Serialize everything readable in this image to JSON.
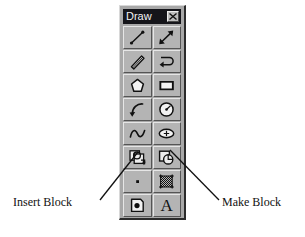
{
  "window": {
    "title": "Draw",
    "close_icon": "close-icon",
    "title_bar_color": "#15151a",
    "face_color": "#a8a8a8",
    "button_face_color": "#b4b4b4"
  },
  "toolbar": {
    "name": "Draw",
    "columns": 2,
    "rows": 8,
    "buttons": [
      {
        "row": 1,
        "col": 1,
        "name": "line",
        "icon": "line-icon",
        "tooltip": "Line"
      },
      {
        "row": 1,
        "col": 2,
        "name": "construction-line",
        "icon": "construction-line-icon",
        "tooltip": "Construction Line"
      },
      {
        "row": 2,
        "col": 1,
        "name": "multiline",
        "icon": "multiline-icon",
        "tooltip": "Multiline"
      },
      {
        "row": 2,
        "col": 2,
        "name": "polyline",
        "icon": "polyline-icon",
        "tooltip": "Polyline"
      },
      {
        "row": 3,
        "col": 1,
        "name": "polygon",
        "icon": "polygon-icon",
        "tooltip": "Polygon"
      },
      {
        "row": 3,
        "col": 2,
        "name": "rectangle",
        "icon": "rectangle-icon",
        "tooltip": "Rectangle"
      },
      {
        "row": 4,
        "col": 1,
        "name": "arc",
        "icon": "arc-icon",
        "tooltip": "Arc"
      },
      {
        "row": 4,
        "col": 2,
        "name": "circle",
        "icon": "circle-icon",
        "tooltip": "Circle"
      },
      {
        "row": 5,
        "col": 1,
        "name": "spline",
        "icon": "spline-icon",
        "tooltip": "Spline"
      },
      {
        "row": 5,
        "col": 2,
        "name": "ellipse",
        "icon": "ellipse-icon",
        "tooltip": "Ellipse"
      },
      {
        "row": 6,
        "col": 1,
        "name": "insert-block",
        "icon": "insert-block-icon",
        "tooltip": "Insert Block"
      },
      {
        "row": 6,
        "col": 2,
        "name": "make-block",
        "icon": "make-block-icon",
        "tooltip": "Make Block"
      },
      {
        "row": 7,
        "col": 1,
        "name": "point",
        "icon": "point-icon",
        "tooltip": "Point"
      },
      {
        "row": 7,
        "col": 2,
        "name": "hatch",
        "icon": "hatch-icon",
        "tooltip": "Hatch"
      },
      {
        "row": 8,
        "col": 1,
        "name": "region",
        "icon": "region-icon",
        "tooltip": "Region"
      },
      {
        "row": 8,
        "col": 2,
        "name": "multiline-text",
        "icon": "text-icon",
        "glyph": "A",
        "tooltip": "Multiline Text"
      }
    ]
  },
  "annotations": [
    {
      "name": "insert-block",
      "label": "Insert Block",
      "points_to": "insert-block-button"
    },
    {
      "name": "make-block",
      "label": "Make Block",
      "points_to": "make-block-button"
    }
  ]
}
